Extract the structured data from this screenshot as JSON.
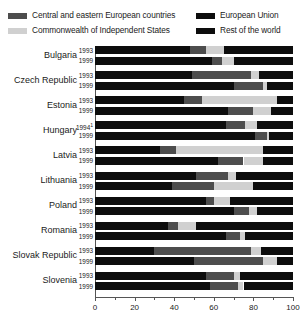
{
  "legend": {
    "items": [
      {
        "label": "Central and eastern European countries",
        "color": "#4d4d4d",
        "key": "cee",
        "col": "left"
      },
      {
        "label": "Commonwealth of Independent States",
        "color": "#d0d0d0",
        "key": "cis",
        "col": "left"
      },
      {
        "label": "European Union",
        "color": "#0d0d0d",
        "key": "eu",
        "col": "right"
      },
      {
        "label": "Rest of the world",
        "color": "#0d0d0d",
        "key": "row",
        "col": "right"
      }
    ]
  },
  "axis": {
    "ticks": [
      0,
      20,
      40,
      60,
      80,
      100
    ],
    "minor_ticks": [
      10,
      30,
      50,
      70,
      90
    ],
    "min": 0,
    "max": 100
  },
  "chart_data": {
    "type": "bar",
    "orientation": "horizontal",
    "stacked": true,
    "title": "",
    "xlabel": "",
    "ylabel": "",
    "xlim": [
      0,
      100
    ],
    "grid": false,
    "legend_position": "top",
    "series": [
      {
        "name": "European Union",
        "key": "eu",
        "color": "#0d0d0d"
      },
      {
        "name": "Central and eastern European countries",
        "key": "cee",
        "color": "#4d4d4d"
      },
      {
        "name": "Commonwealth of Independent States",
        "key": "cis",
        "color": "#d0d0d0"
      },
      {
        "name": "Rest of the world",
        "key": "row",
        "color": "#0d0d0d"
      }
    ],
    "categories": [
      "Bulgaria",
      "Czech Republic",
      "Estonia",
      "Hungary",
      "Latvia",
      "Lithuania",
      "Poland",
      "Romania",
      "Slovak Republic",
      "Slovenia"
    ],
    "groups": [
      {
        "country": "Bulgaria",
        "rows": [
          {
            "year": "1993",
            "footnote": "",
            "eu": 48,
            "cee": 8,
            "cis": 9,
            "row": 35
          },
          {
            "year": "1999",
            "footnote": "",
            "eu": 59,
            "cee": 5,
            "cis": 6,
            "row": 30
          }
        ]
      },
      {
        "country": "Czech Republic",
        "rows": [
          {
            "year": "1993",
            "footnote": "",
            "eu": 49,
            "cee": 30,
            "cis": 4,
            "row": 17
          },
          {
            "year": "1999",
            "footnote": "",
            "eu": 70,
            "cee": 15,
            "cis": 2,
            "row": 13
          }
        ]
      },
      {
        "country": "Estonia",
        "rows": [
          {
            "year": "1993",
            "footnote": "",
            "eu": 45,
            "cee": 9,
            "cis": 38,
            "row": 8
          },
          {
            "year": "1999",
            "footnote": "",
            "eu": 67,
            "cee": 13,
            "cis": 9,
            "row": 11
          }
        ]
      },
      {
        "country": "Hungary",
        "rows": [
          {
            "year": "1994",
            "footnote": "1",
            "eu": 66,
            "cee": 10,
            "cis": 6,
            "row": 18
          },
          {
            "year": "1999",
            "footnote": "",
            "eu": 81,
            "cee": 6,
            "cis": 1,
            "row": 12
          }
        ]
      },
      {
        "country": "Latvia",
        "rows": [
          {
            "year": "1993",
            "footnote": "",
            "eu": 33,
            "cee": 8,
            "cis": 44,
            "row": 15
          },
          {
            "year": "1999",
            "footnote": "",
            "eu": 62,
            "cee": 13,
            "cis": 10,
            "row": 15
          }
        ]
      },
      {
        "country": "Lithuania",
        "rows": [
          {
            "year": "1993",
            "footnote": "",
            "eu": 51,
            "cee": 16,
            "cis": 4,
            "row": 29
          },
          {
            "year": "1999",
            "footnote": "",
            "eu": 39,
            "cee": 21,
            "cis": 20,
            "row": 20
          }
        ]
      },
      {
        "country": "Poland",
        "rows": [
          {
            "year": "1993",
            "footnote": "",
            "eu": 56,
            "cee": 4,
            "cis": 8,
            "row": 32
          },
          {
            "year": "1999",
            "footnote": "",
            "eu": 70,
            "cee": 8,
            "cis": 4,
            "row": 18
          }
        ]
      },
      {
        "country": "Romania",
        "rows": [
          {
            "year": "1993",
            "footnote": "",
            "eu": 37,
            "cee": 5,
            "cis": 9,
            "row": 49
          },
          {
            "year": "1999",
            "footnote": "",
            "eu": 66,
            "cee": 7,
            "cis": 3,
            "row": 24
          }
        ]
      },
      {
        "country": "Slovak Republic",
        "rows": [
          {
            "year": "1993",
            "footnote": "",
            "eu": 30,
            "cee": 49,
            "cis": 5,
            "row": 16
          },
          {
            "year": "1999",
            "footnote": "",
            "eu": 50,
            "cee": 35,
            "cis": 7,
            "row": 8
          }
        ]
      },
      {
        "country": "Slovenia",
        "rows": [
          {
            "year": "1993",
            "footnote": "",
            "eu": 56,
            "cee": 14,
            "cis": 3,
            "row": 27
          },
          {
            "year": "1999",
            "footnote": "",
            "eu": 58,
            "cee": 14,
            "cis": 3,
            "row": 25
          }
        ]
      }
    ]
  }
}
